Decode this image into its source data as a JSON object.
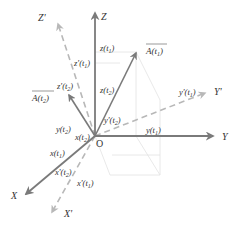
{
  "diagram": {
    "type": "3d-coordinate-frames",
    "colors": {
      "axis": "#7a7a7a",
      "dashed_axis": "#b8b8b8",
      "guide": "#e2e2e2",
      "text": "#333333"
    },
    "origin": {
      "label": "O"
    },
    "axes": {
      "x": {
        "label": "X"
      },
      "y": {
        "label": "Y"
      },
      "z": {
        "label": "Z"
      },
      "x_prime": {
        "label": "X'"
      },
      "y_prime": {
        "label": "Y'"
      },
      "z_prime": {
        "label": "Z'"
      }
    },
    "vectors": {
      "a_t1": {
        "label": "A(t",
        "sub": "1",
        "close": ")"
      },
      "a_t2": {
        "label": "A(t",
        "sub": "2",
        "close": ")"
      }
    },
    "components": {
      "z_t1": {
        "label": "z(t",
        "sub": "1",
        "close": ")"
      },
      "z_t2": {
        "label": "z(t",
        "sub": "2",
        "close": ")"
      },
      "zp_t1": {
        "label": "z'(t",
        "sub": "1",
        "close": ")"
      },
      "zp_t2": {
        "label": "z'(t",
        "sub": "2",
        "close": ")"
      },
      "y_t1": {
        "label": "y(t",
        "sub": "1",
        "close": ")"
      },
      "y_t2": {
        "label": "y(t",
        "sub": "2",
        "close": ")"
      },
      "yp_t1": {
        "label": "y'(t",
        "sub": "1",
        "close": ")"
      },
      "yp_t2": {
        "label": "y'(t",
        "sub": "2",
        "close": ")"
      },
      "x_t1": {
        "label": "x(t",
        "sub": "1",
        "close": ")"
      },
      "x_t2": {
        "label": "x(t",
        "sub": "2",
        "close": ")"
      },
      "xp_t1": {
        "label": "x'(t",
        "sub": "1",
        "close": ")"
      },
      "xp_t2": {
        "label": "x'(t",
        "sub": "2",
        "close": ")"
      }
    }
  }
}
